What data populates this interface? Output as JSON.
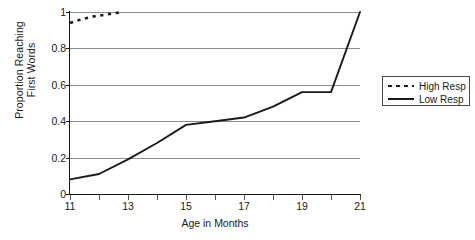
{
  "chart_data": {
    "type": "line",
    "title": "",
    "xlabel": "Age in Months",
    "ylabel_lines": [
      "Proportion Reaching",
      "First Words"
    ],
    "ylabel": "Proportion Reaching First Words",
    "x": [
      11,
      12,
      13,
      14,
      15,
      16,
      17,
      18,
      19,
      20,
      21
    ],
    "xlim": [
      11,
      21
    ],
    "ylim": [
      0,
      1
    ],
    "xticks": [
      11,
      12,
      13,
      14,
      15,
      16,
      17,
      18,
      19,
      20,
      21
    ],
    "xtick_labels": [
      "11",
      "",
      "13",
      "",
      "15",
      "",
      "17",
      "",
      "19",
      "",
      "21"
    ],
    "yticks": [
      0,
      0.2,
      0.4,
      0.6,
      0.8,
      1
    ],
    "ytick_labels": [
      "0",
      "0.2",
      "0.4",
      "0.6",
      "0.8",
      "1"
    ],
    "grid": "horizontal",
    "legend_position": "right-outside",
    "series": [
      {
        "name": "High Resp",
        "style": "dashed",
        "color": "#1a1a1a",
        "x": [
          11,
          11.4,
          11.8,
          12.2,
          12.6,
          12.8
        ],
        "values": [
          0.94,
          0.96,
          0.975,
          0.985,
          0.995,
          1.0
        ]
      },
      {
        "name": "Low Resp",
        "style": "solid",
        "color": "#1a1a1a",
        "x": [
          11,
          12,
          13,
          14,
          15,
          16,
          17,
          18,
          19,
          20,
          21
        ],
        "values": [
          0.08,
          0.11,
          0.19,
          0.28,
          0.38,
          0.4,
          0.42,
          0.48,
          0.56,
          0.56,
          1.0
        ]
      }
    ]
  },
  "legend": {
    "items": [
      {
        "label": "High Resp",
        "style": "dashed"
      },
      {
        "label": "Low Resp",
        "style": "solid"
      }
    ]
  }
}
